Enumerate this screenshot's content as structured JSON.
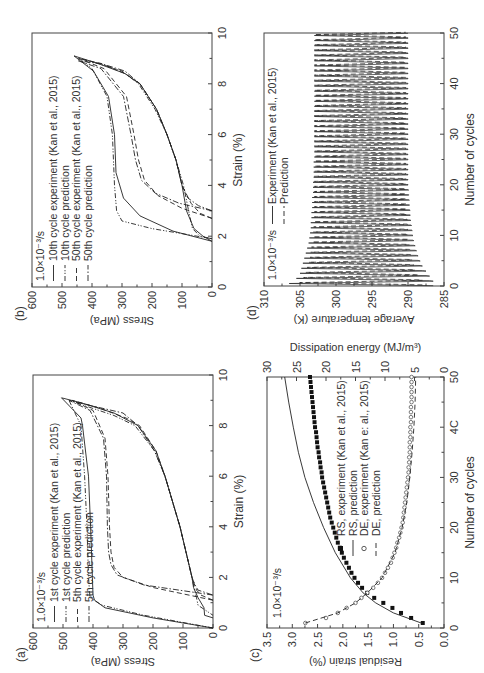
{
  "figure": {
    "orientation": "rotated 90 degrees counter-clockwise",
    "rate_label": "1.0×10⁻³/s"
  },
  "chart_data": [
    {
      "panel": "(a)",
      "type": "line",
      "title": "",
      "xlabel": "Strain (%)",
      "ylabel": "Stress (MPa)",
      "xlim": [
        0,
        10
      ],
      "ylim": [
        0,
        600
      ],
      "xticks": [
        0,
        2,
        4,
        6,
        8,
        10
      ],
      "yticks": [
        0,
        100,
        200,
        300,
        400,
        500,
        600
      ],
      "annotation": "1.0×10⁻³/s",
      "legend": [
        "1st cycle experiment (Kan et al., 2015)",
        "1st cycle prediction",
        "5th cycle experiment (Kan et al., 2015)",
        "5th cycle prediction"
      ],
      "legend_position": "upper left",
      "grid": false,
      "series": [
        {
          "name": "1st cycle experiment (Kan et al., 2015)",
          "style": "solid",
          "x": [
            0,
            0.4,
            0.8,
            1.1,
            1.3,
            2,
            4,
            6,
            8,
            8.3,
            9.1,
            8.9,
            8.5,
            8,
            7,
            6,
            5,
            4,
            3,
            2,
            1.6,
            1.2,
            0.8,
            0.5,
            0.4
          ],
          "y": [
            0,
            200,
            360,
            395,
            400,
            402,
            408,
            415,
            435,
            440,
            505,
            440,
            330,
            250,
            190,
            160,
            135,
            110,
            90,
            70,
            65,
            50,
            30,
            28,
            0
          ]
        },
        {
          "name": "1st cycle prediction",
          "style": "dashdotdot",
          "x": [
            0,
            0.5,
            0.9,
            1.2,
            2,
            4,
            6,
            8,
            9.0,
            8.8,
            8.4,
            8,
            7,
            6,
            5,
            4,
            3,
            2,
            1.4,
            1.2,
            0.9,
            0.5
          ],
          "y": [
            0,
            230,
            370,
            410,
            415,
            420,
            428,
            440,
            480,
            430,
            330,
            260,
            195,
            160,
            135,
            110,
            90,
            70,
            60,
            55,
            50,
            0
          ]
        },
        {
          "name": "5th cycle experiment (Kan et al., 2015)",
          "style": "dashed",
          "x": [
            1.1,
            1.6,
            2.0,
            2.4,
            3,
            4,
            6,
            7.5,
            8.6,
            9.0,
            8.7,
            8.3,
            8,
            7,
            6,
            5,
            4,
            3,
            2,
            1.5,
            1.3,
            1.1
          ],
          "y": [
            0,
            200,
            300,
            330,
            340,
            345,
            350,
            360,
            400,
            470,
            380,
            290,
            245,
            190,
            160,
            135,
            110,
            90,
            70,
            55,
            40,
            0
          ]
        },
        {
          "name": "5th cycle prediction",
          "style": "dashdot",
          "x": [
            1.3,
            1.7,
            2.1,
            2.5,
            3,
            4,
            6,
            7.5,
            8.6,
            9.0,
            8.8,
            8.5,
            8,
            7,
            6,
            5,
            4,
            3,
            2,
            1.7,
            1.5,
            1.3
          ],
          "y": [
            0,
            230,
            320,
            340,
            348,
            352,
            355,
            365,
            410,
            480,
            410,
            300,
            250,
            195,
            160,
            135,
            110,
            90,
            70,
            60,
            50,
            0
          ]
        }
      ]
    },
    {
      "panel": "(b)",
      "type": "line",
      "title": "",
      "xlabel": "Strain (%)",
      "ylabel": "Stress (MPa)",
      "xlim": [
        0,
        10
      ],
      "ylim": [
        0,
        600
      ],
      "xticks": [
        0,
        2,
        4,
        6,
        8,
        10
      ],
      "yticks": [
        0,
        100,
        200,
        300,
        400,
        500,
        600
      ],
      "annotation": "1.0×10⁻³/s",
      "legend": [
        "10th cycle experiment (Kan et al., 2015)",
        "10th cycle prediction",
        "50th cycle experiment (Kan et al., 2015)",
        "50th cycle prediction"
      ],
      "legend_position": "upper left",
      "grid": false,
      "series": [
        {
          "name": "10th cycle experiment (Kan et al., 2015)",
          "style": "solid",
          "x": [
            1.8,
            2.2,
            2.8,
            3.5,
            4.5,
            6,
            7.5,
            8.5,
            9.1,
            8.8,
            8.4,
            8,
            7,
            6,
            5,
            4,
            3,
            2.3,
            2.0,
            1.8
          ],
          "y": [
            0,
            130,
            240,
            295,
            320,
            325,
            345,
            395,
            460,
            380,
            290,
            240,
            185,
            150,
            120,
            100,
            85,
            60,
            30,
            0
          ]
        },
        {
          "name": "10th cycle prediction",
          "style": "dashdotdot",
          "x": [
            1.9,
            2.3,
            2.6,
            3,
            4,
            6,
            7.5,
            8.6,
            9.0,
            8.8,
            8.5,
            8,
            7,
            6,
            5,
            4,
            3,
            2.3,
            2.0,
            1.9
          ],
          "y": [
            0,
            200,
            300,
            318,
            325,
            332,
            350,
            400,
            445,
            380,
            300,
            245,
            190,
            150,
            120,
            95,
            78,
            65,
            40,
            0
          ]
        },
        {
          "name": "50th cycle experiment (Kan et al., 2015)",
          "style": "dashed",
          "x": [
            2.7,
            3.1,
            3.6,
            4.2,
            5,
            6,
            7.5,
            8.6,
            9.0,
            8.8,
            8.4,
            8,
            7,
            6,
            5,
            4,
            3.3,
            2.9,
            2.7
          ],
          "y": [
            0,
            100,
            180,
            225,
            245,
            260,
            285,
            360,
            445,
            370,
            290,
            240,
            185,
            150,
            120,
            100,
            70,
            40,
            0
          ]
        },
        {
          "name": "50th cycle prediction",
          "style": "dashdot",
          "x": [
            3.0,
            3.3,
            3.7,
            4.2,
            5,
            6,
            7.5,
            8.6,
            8.9,
            8.8,
            8.5,
            8,
            7,
            6,
            5,
            4,
            3.5,
            3.2,
            3.0
          ],
          "y": [
            0,
            110,
            190,
            235,
            255,
            270,
            295,
            370,
            445,
            370,
            290,
            240,
            185,
            150,
            120,
            100,
            80,
            45,
            0
          ]
        }
      ]
    },
    {
      "panel": "(c)",
      "type": "scatter",
      "title": "",
      "xlabel": "Number of cycles",
      "ylabel": "Residual strain (%)",
      "y2label": "Dissipation energy (MJ/m³)",
      "xlim": [
        0,
        50
      ],
      "ylim": [
        0,
        3.5
      ],
      "y2lim": [
        0,
        30
      ],
      "xticks": [
        0,
        10,
        20,
        30,
        40,
        50
      ],
      "xtick_labels": [
        "0",
        "10",
        "20",
        "30",
        "4C",
        "50"
      ],
      "yticks": [
        0.0,
        0.5,
        1.0,
        1.5,
        2.0,
        2.5,
        3.0,
        3.5
      ],
      "y2ticks": [
        0,
        5,
        10,
        15,
        20,
        25,
        30
      ],
      "annotation": "1.0×10⁻³/s",
      "legend": [
        "RS, experiment (Kan et al., 2015)",
        "RS, prediction",
        "DE, experiment (Kan et al., 2015)",
        "DE, prediction"
      ],
      "legend_typos_visible": "DE, experiment (Kan e: al., 2015)",
      "legend_position": "center",
      "grid": false,
      "series": [
        {
          "name": "RS, experiment (Kan et al., 2015)",
          "axis": "left",
          "marker": "filled-square",
          "x": [
            1,
            2,
            3,
            4,
            5,
            6,
            7,
            8,
            9,
            10,
            11,
            12,
            13,
            14,
            15,
            16,
            17,
            18,
            19,
            20,
            21,
            22,
            23,
            24,
            25,
            26,
            27,
            28,
            29,
            30,
            31,
            32,
            33,
            34,
            35,
            36,
            37,
            38,
            39,
            40,
            41,
            42,
            43,
            44,
            45,
            46,
            47,
            48,
            49,
            50
          ],
          "y": [
            0.42,
            0.65,
            0.85,
            1.02,
            1.2,
            1.38,
            1.52,
            1.62,
            1.7,
            1.77,
            1.83,
            1.88,
            1.93,
            1.98,
            2.02,
            2.06,
            2.1,
            2.13,
            2.16,
            2.19,
            2.22,
            2.25,
            2.27,
            2.29,
            2.31,
            2.33,
            2.35,
            2.37,
            2.39,
            2.41,
            2.42,
            2.44,
            2.45,
            2.47,
            2.48,
            2.5,
            2.51,
            2.52,
            2.53,
            2.55,
            2.56,
            2.57,
            2.58,
            2.59,
            2.6,
            2.61,
            2.62,
            2.63,
            2.64,
            2.65
          ]
        },
        {
          "name": "RS, prediction",
          "axis": "left",
          "style": "solid",
          "x": [
            1,
            3,
            5,
            7,
            10,
            15,
            20,
            25,
            30,
            35,
            40,
            45,
            50
          ],
          "y": [
            0.45,
            1.0,
            1.35,
            1.6,
            1.85,
            2.15,
            2.38,
            2.58,
            2.75,
            2.88,
            2.98,
            3.07,
            3.15
          ]
        },
        {
          "name": "DE, experiment (Kan et al., 2015)",
          "axis": "right",
          "marker": "open-circle",
          "x": [
            1,
            2,
            3,
            4,
            5,
            6,
            7,
            8,
            9,
            10,
            11,
            12,
            13,
            14,
            15,
            16,
            17,
            18,
            19,
            20,
            21,
            22,
            23,
            24,
            25,
            26,
            27,
            28,
            29,
            30,
            31,
            32,
            33,
            34,
            35,
            36,
            37,
            38,
            39,
            40,
            41,
            42,
            43,
            44,
            45,
            46,
            47,
            48,
            49,
            50
          ],
          "y": [
            23.5,
            20,
            18,
            16.5,
            15,
            14,
            13,
            12,
            11.2,
            10.5,
            10,
            9.5,
            9,
            8.7,
            8.4,
            8.1,
            7.9,
            7.6,
            7.4,
            7.2,
            7.0,
            6.9,
            6.8,
            6.7,
            6.6,
            6.5,
            6.4,
            6.3,
            6.2,
            6.1,
            6.0,
            6.0,
            5.9,
            5.9,
            5.8,
            5.8,
            5.8,
            5.7,
            5.7,
            5.7,
            5.6,
            5.6,
            5.6,
            5.6,
            5.5,
            5.5,
            5.5,
            5.5,
            5.5,
            5.5
          ]
        },
        {
          "name": "DE, prediction",
          "axis": "right",
          "style": "dashed",
          "x": [
            1,
            3,
            5,
            7,
            10,
            15,
            20,
            25,
            30,
            35,
            40,
            45,
            50
          ],
          "y": [
            23.5,
            18,
            15,
            13,
            10.5,
            8.3,
            7.1,
            6.3,
            5.8,
            5.4,
            5.1,
            4.9,
            4.8
          ]
        }
      ]
    },
    {
      "panel": "(d)",
      "type": "line",
      "title": "",
      "xlabel": "Number of cycles",
      "ylabel": "Average temperature (K)",
      "xlim": [
        0,
        50
      ],
      "ylim": [
        285,
        310
      ],
      "xticks": [
        0,
        10,
        20,
        30,
        40,
        50
      ],
      "yticks": [
        285,
        290,
        295,
        300,
        305,
        310
      ],
      "annotation": "1.0×10⁻³/s",
      "legend": [
        "Experiment (Kan et al., 2015)",
        "Prediction"
      ],
      "legend_position": "upper left",
      "grid": false,
      "series": [
        {
          "name": "Experiment (Kan et al., 2015)",
          "style": "solid",
          "cycles": 50,
          "peak_max": [
            306.5,
            305.5,
            305,
            304.8,
            304.6,
            304.4,
            304.2,
            304,
            303.8,
            303.7,
            303.6,
            303.5,
            303.5,
            303.4,
            303.4,
            303.3,
            303.3,
            303.3,
            303.2,
            303.2,
            303.2,
            303.1,
            303.1,
            303.1,
            303.1,
            303,
            303,
            303,
            303,
            303,
            303,
            303,
            303,
            303,
            303,
            303,
            303,
            303,
            303,
            303,
            303,
            303,
            303,
            303,
            303,
            303,
            303,
            303,
            303,
            303
          ],
          "trough_min": [
            286.5,
            287,
            287.5,
            288,
            288.3,
            288.6,
            288.8,
            289,
            289.2,
            289.3,
            289.4,
            289.5,
            289.6,
            289.7,
            289.7,
            289.8,
            289.8,
            289.9,
            289.9,
            290,
            290,
            290,
            290,
            290,
            290,
            290,
            290,
            290,
            290,
            290,
            290,
            290,
            290,
            290,
            290,
            290,
            290,
            290,
            290,
            290,
            290,
            290,
            290,
            290,
            290,
            290,
            290,
            290,
            290,
            290
          ]
        },
        {
          "name": "Prediction",
          "style": "dashed",
          "cycles": 50,
          "peak_max": [
            305,
            304.5,
            304.2,
            304,
            303.8,
            303.6,
            303.5,
            303.4,
            303.3,
            303.2,
            303.2,
            303.1,
            303.1,
            303,
            303,
            303,
            303,
            303,
            303,
            303,
            303,
            303,
            303,
            303,
            303,
            303,
            303,
            303,
            303,
            303,
            303,
            303,
            303,
            303,
            303,
            303,
            303,
            303,
            303,
            303,
            303,
            303,
            303,
            303,
            303,
            303,
            303,
            303,
            303,
            303
          ],
          "trough_min": [
            288,
            288.5,
            289,
            289.2,
            289.4,
            289.6,
            289.7,
            289.8,
            289.9,
            290,
            290,
            290.1,
            290.1,
            290.2,
            290.2,
            290.2,
            290.3,
            290.3,
            290.3,
            290.3,
            290.3,
            290.3,
            290.3,
            290.3,
            290.3,
            290.3,
            290.3,
            290.3,
            290.3,
            290.3,
            290.3,
            290.3,
            290.3,
            290.3,
            290.3,
            290.3,
            290.3,
            290.3,
            290.3,
            290.3,
            290.3,
            290.3,
            290.3,
            290.3,
            290.3,
            290.3,
            290.3,
            290.3,
            290.3,
            290.3
          ]
        }
      ]
    }
  ]
}
